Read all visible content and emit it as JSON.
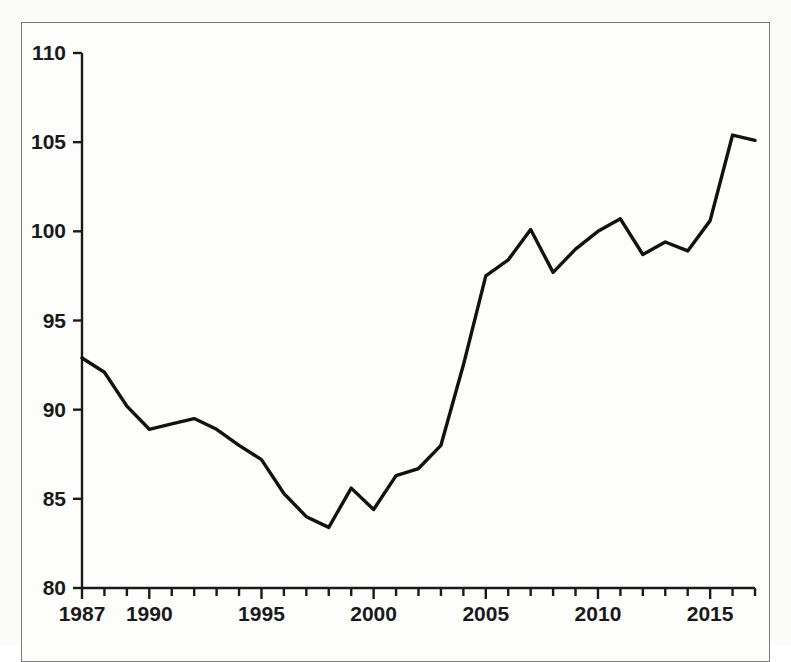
{
  "chart_data": {
    "type": "line",
    "title": "",
    "subtitle": "",
    "xlabel": "",
    "ylabel": "",
    "xlim": [
      1987,
      2017
    ],
    "ylim": [
      80,
      110
    ],
    "grid": false,
    "legend": null,
    "x_ticks_major": [
      1987,
      1990,
      1995,
      2000,
      2005,
      2010,
      2015
    ],
    "x_tick_labels": [
      "1987",
      "1990",
      "1995",
      "2000",
      "2005",
      "2010",
      "2015"
    ],
    "x_ticks_minor_step": 1,
    "y_ticks": [
      80,
      85,
      90,
      95,
      100,
      105,
      110
    ],
    "y_tick_labels": [
      "80",
      "85",
      "90",
      "95",
      "100",
      "105",
      "110"
    ],
    "line_color": "#111111",
    "line_width": 3.4,
    "x": [
      1987,
      1988,
      1989,
      1990,
      1991,
      1992,
      1993,
      1994,
      1995,
      1996,
      1997,
      1998,
      1999,
      2000,
      2001,
      2002,
      2003,
      2004,
      2005,
      2006,
      2007,
      2008,
      2009,
      2010,
      2011,
      2012,
      2013,
      2014,
      2015,
      2016,
      2017
    ],
    "values": [
      92.9,
      92.1,
      90.2,
      88.9,
      89.2,
      89.5,
      88.9,
      88.0,
      87.2,
      85.3,
      84.0,
      83.4,
      85.6,
      84.4,
      86.3,
      86.7,
      88.0,
      92.5,
      97.5,
      98.4,
      100.1,
      97.7,
      99.0,
      100.0,
      100.7,
      98.7,
      99.4,
      98.9,
      100.6,
      105.4,
      105.1
    ],
    "series": [
      {
        "name": "series-1",
        "values": [
          92.9,
          92.1,
          90.2,
          88.9,
          89.2,
          89.5,
          88.9,
          88.0,
          87.2,
          85.3,
          84.0,
          83.4,
          85.6,
          84.4,
          86.3,
          86.7,
          88.0,
          92.5,
          97.5,
          98.4,
          100.1,
          97.7,
          99.0,
          100.0,
          100.7,
          98.7,
          99.4,
          98.9,
          100.6,
          105.4,
          105.1
        ]
      }
    ]
  },
  "colors": {
    "line": "#111111",
    "axis": "#1a1a1a",
    "frame": "#7a7a7a",
    "background": "#fdfdfc",
    "text": "#1a1a1a"
  }
}
